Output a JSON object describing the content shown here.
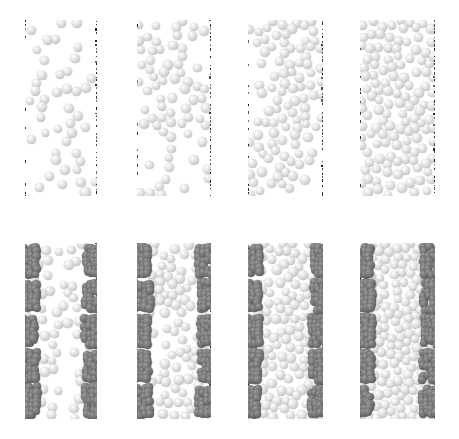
{
  "figure": {
    "background_color": "#ffffff",
    "width": 459,
    "height": 439,
    "rows": 2,
    "columns": 4
  },
  "colors": {
    "particle_light": "#e2e2e2",
    "particle_light_highlight": "#ffffff",
    "particle_light_shade": "#a2a2a2",
    "particle_dark": "#6b6b6b",
    "particle_dark_shade": "#4a4a4a",
    "wall_marker": "#1a1a1a",
    "background": "#ffffff"
  },
  "legend_semantics": {
    "light_sphere_label": "mobile grain",
    "dark_sphere_label": "wall-attached rough patch grain",
    "dotted_line_label": "confining wall boundary"
  },
  "chart_data": {
    "type": "scatter",
    "xlabel": "",
    "ylabel": "",
    "grid": false,
    "legend_position": "none",
    "panel_layout": {
      "rows": 2,
      "cols": 4
    },
    "row_labels": [
      "smooth walls",
      "patterned (rough-patch) walls"
    ],
    "series": [
      {
        "name": "panel-1-top",
        "packing_fraction": 0.22,
        "wall_type": "smooth",
        "n_particles": 150
      },
      {
        "name": "panel-2-top",
        "packing_fraction": 0.34,
        "wall_type": "smooth",
        "n_particles": 230
      },
      {
        "name": "panel-3-top",
        "packing_fraction": 0.47,
        "wall_type": "smooth",
        "n_particles": 320
      },
      {
        "name": "panel-4-top",
        "packing_fraction": 0.62,
        "wall_type": "smooth",
        "n_particles": 430
      },
      {
        "name": "panel-1-bottom",
        "packing_fraction": 0.22,
        "wall_type": "patched",
        "n_particles": 150,
        "n_patches_per_wall": 5
      },
      {
        "name": "panel-2-bottom",
        "packing_fraction": 0.34,
        "wall_type": "patched",
        "n_particles": 230,
        "n_patches_per_wall": 5
      },
      {
        "name": "panel-3-bottom",
        "packing_fraction": 0.47,
        "wall_type": "patched",
        "n_particles": 320,
        "n_patches_per_wall": 5
      },
      {
        "name": "panel-4-bottom",
        "packing_fraction": 0.62,
        "wall_type": "patched",
        "n_particles": 430,
        "n_patches_per_wall": 5
      }
    ]
  },
  "panels": [
    {
      "id": "panel-1-top",
      "row": 0,
      "col": 0,
      "x": 25,
      "y": 20,
      "w": 72,
      "h": 176,
      "wall_type": "smooth",
      "patches": 0,
      "density": 0.22,
      "radius": 4.6,
      "jitter": 0.55,
      "band_left": 0.3,
      "band_right": 0.3,
      "gap_center": 0.52,
      "seed": 1101
    },
    {
      "id": "panel-2-top",
      "row": 0,
      "col": 1,
      "x": 137,
      "y": 20,
      "w": 74,
      "h": 176,
      "wall_type": "smooth",
      "patches": 0,
      "density": 0.34,
      "radius": 4.6,
      "jitter": 0.6,
      "band_left": 0.36,
      "band_right": 0.34,
      "gap_center": 0.5,
      "seed": 2202
    },
    {
      "id": "panel-3-top",
      "row": 0,
      "col": 2,
      "x": 248,
      "y": 20,
      "w": 75,
      "h": 176,
      "wall_type": "smooth",
      "patches": 0,
      "density": 0.47,
      "radius": 4.6,
      "jitter": 0.65,
      "band_left": 0.44,
      "band_right": 0.42,
      "gap_center": 0.5,
      "seed": 3303
    },
    {
      "id": "panel-4-top",
      "row": 0,
      "col": 3,
      "x": 360,
      "y": 20,
      "w": 75,
      "h": 176,
      "wall_type": "smooth",
      "patches": 0,
      "density": 0.62,
      "radius": 4.6,
      "jitter": 0.7,
      "band_left": 0.6,
      "band_right": 0.6,
      "gap_center": 0.5,
      "seed": 4404
    },
    {
      "id": "panel-1-bottom",
      "row": 1,
      "col": 0,
      "x": 25,
      "y": 243,
      "w": 72,
      "h": 176,
      "wall_type": "patched",
      "patches": 5,
      "density": 0.24,
      "radius": 4.6,
      "jitter": 0.55,
      "band_left": 0.32,
      "band_right": 0.32,
      "gap_center": 0.52,
      "seed": 5505
    },
    {
      "id": "panel-2-bottom",
      "row": 1,
      "col": 1,
      "x": 137,
      "y": 243,
      "w": 74,
      "h": 176,
      "wall_type": "patched",
      "patches": 5,
      "density": 0.36,
      "radius": 4.6,
      "jitter": 0.6,
      "band_left": 0.4,
      "band_right": 0.38,
      "gap_center": 0.5,
      "seed": 6606
    },
    {
      "id": "panel-3-bottom",
      "row": 1,
      "col": 2,
      "x": 248,
      "y": 243,
      "w": 75,
      "h": 176,
      "wall_type": "patched",
      "patches": 5,
      "density": 0.5,
      "radius": 4.6,
      "jitter": 0.65,
      "band_left": 0.48,
      "band_right": 0.46,
      "gap_center": 0.5,
      "seed": 7707
    },
    {
      "id": "panel-4-bottom",
      "row": 1,
      "col": 3,
      "x": 360,
      "y": 243,
      "w": 75,
      "h": 176,
      "wall_type": "patched",
      "patches": 5,
      "density": 0.64,
      "radius": 4.6,
      "jitter": 0.7,
      "band_left": 0.62,
      "band_right": 0.62,
      "gap_center": 0.5,
      "seed": 8808
    }
  ]
}
